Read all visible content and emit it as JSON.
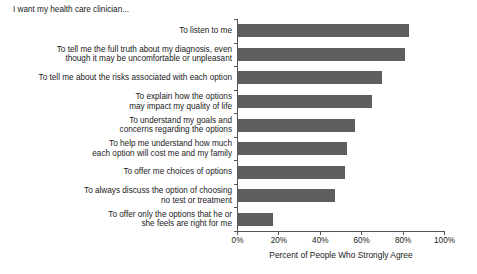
{
  "chart_data": {
    "type": "bar",
    "orientation": "horizontal",
    "title": "I want my health care clinician...",
    "xlabel": "Percent of People Who Strongly Agree",
    "ylabel": "",
    "xlim": [
      0,
      100
    ],
    "xticks": [
      0,
      20,
      40,
      60,
      80,
      100
    ],
    "xticklabels": [
      "0%",
      "20%",
      "40%",
      "60%",
      "80%",
      "100%"
    ],
    "grid": false,
    "legend": null,
    "bar_color": "#5e5e5e",
    "axis_color": "#555555",
    "categories": [
      "To listen to me",
      "To tell me the full truth about my diagnosis, even\nthough it may be uncomfortable or unpleasant",
      "To tell me about the risks associated with each option",
      "To explain how the options\nmay impact my quality of life",
      "To understand my goals and\nconcerns regarding the options",
      "To help me understand how much\neach option will cost me and my family",
      "To offer me choices of options",
      "To always discuss the option of choosing\nno test or treatment",
      "To offer only the options that he or\nshe feels are right for me"
    ],
    "values": [
      83,
      81,
      70,
      65,
      57,
      53,
      52,
      47,
      17
    ]
  }
}
